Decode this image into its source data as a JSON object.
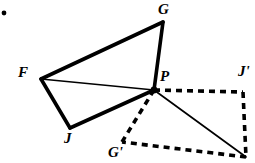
{
  "figure": {
    "background_color": "#ffffff",
    "stroke_color": "#000000",
    "width": 255,
    "height": 163,
    "stray_dot": {
      "name": "stray-dot",
      "x": 4,
      "y": 13,
      "r": 2.4
    },
    "points": {
      "F": {
        "label": "F",
        "x": 41,
        "y": 79,
        "label_x": 18,
        "label_y": 65
      },
      "G": {
        "label": "G",
        "x": 163,
        "y": 22,
        "label_x": 158,
        "label_y": 2
      },
      "J": {
        "label": "J",
        "x": 70,
        "y": 128,
        "label_x": 64,
        "label_y": 131
      },
      "P": {
        "label": "P",
        "x": 154,
        "y": 90,
        "label_x": 160,
        "label_y": 69
      },
      "Gp": {
        "label": "G'",
        "x": 122,
        "y": 142,
        "label_x": 108,
        "label_y": 145
      },
      "Jp": {
        "label": "J'",
        "x": 243,
        "y": 92,
        "label_x": 238,
        "label_y": 64
      },
      "Fp": {
        "label": "",
        "x": 246,
        "y": 157,
        "label_x": 0,
        "label_y": 0
      }
    },
    "segments": [
      {
        "name": "segment-F-G",
        "from": "F",
        "to": "G",
        "style": "solid",
        "width": 3.6
      },
      {
        "name": "segment-G-P",
        "from": "G",
        "to": "P",
        "style": "solid",
        "width": 3.6
      },
      {
        "name": "segment-F-J",
        "from": "F",
        "to": "J",
        "style": "solid",
        "width": 3.6
      },
      {
        "name": "segment-J-P",
        "from": "J",
        "to": "P",
        "style": "solid",
        "width": 3.6
      },
      {
        "name": "segment-F-P",
        "from": "F",
        "to": "P",
        "style": "solid",
        "width": 1.4
      },
      {
        "name": "segment-P-Fprime",
        "from": "P",
        "to": "Fp",
        "style": "solid",
        "width": 1.7
      },
      {
        "name": "segment-P-Jprime",
        "from": "P",
        "to": "Jp",
        "style": "dashed",
        "width": 3.6
      },
      {
        "name": "segment-Jprime-Fprime",
        "from": "Jp",
        "to": "Fp",
        "style": "dashed",
        "width": 3.6
      },
      {
        "name": "segment-Fprime-Gprime",
        "from": "Fp",
        "to": "Gp",
        "style": "dashed",
        "width": 3.6
      },
      {
        "name": "segment-Gprime-P",
        "from": "Gp",
        "to": "P",
        "style": "dashed",
        "width": 3.6
      }
    ],
    "dash_pattern": "6 5",
    "markers": [
      {
        "name": "point-marker-P",
        "at": "P",
        "r": 3.4
      }
    ]
  }
}
